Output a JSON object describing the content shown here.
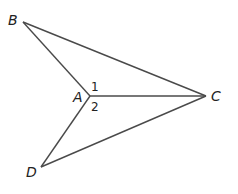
{
  "diagram": {
    "points": {
      "B": {
        "label": "B"
      },
      "A": {
        "label": "A"
      },
      "C": {
        "label": "C"
      },
      "D": {
        "label": "D"
      }
    },
    "angles": {
      "angle1": "1",
      "angle2": "2"
    },
    "segments": [
      "AB",
      "BC",
      "AC",
      "AD",
      "DC"
    ]
  }
}
